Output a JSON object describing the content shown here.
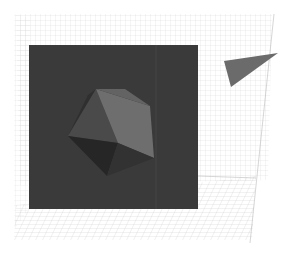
{
  "figure": {
    "colors": {
      "background": "#ffffff",
      "grid_line": "#cfcfcf",
      "panel": "#3a3a3a",
      "octa_light": "#6e6e6e",
      "octa_mid": "#4c4c4c",
      "octa_dark": "#2c2c2c",
      "octa_darkest": "#242424",
      "shard": "#6b6b6b"
    },
    "caption": ""
  }
}
